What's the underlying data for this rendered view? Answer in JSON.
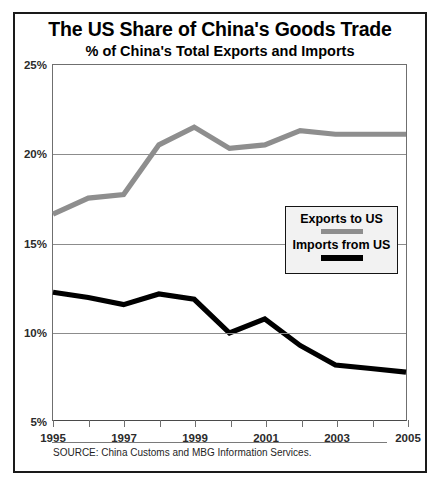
{
  "chart_data": {
    "type": "line",
    "title": "The US Share of China's Goods Trade",
    "subtitle": "% of China's Total Exports and Imports",
    "xlabel": "",
    "ylabel": "",
    "xlim": [
      1995,
      2005
    ],
    "ylim": [
      5,
      25
    ],
    "yticks": [
      25,
      20,
      15,
      10,
      5
    ],
    "ytick_labels": [
      "25%",
      "20%",
      "15%",
      "10%",
      "5%"
    ],
    "x": [
      1995,
      1996,
      1997,
      1998,
      1999,
      2000,
      2001,
      2002,
      2003,
      2004,
      2005
    ],
    "xticks": [
      1995,
      1996,
      1997,
      1998,
      1999,
      2000,
      2001,
      2002,
      2003,
      2004,
      2005
    ],
    "xtick_labels": [
      "1995",
      "",
      "1997",
      "",
      "1999",
      "",
      "2001",
      "",
      "2003",
      "",
      "2005"
    ],
    "grid": true,
    "grid_axis": "y",
    "legend_position": "center-right",
    "series": [
      {
        "name": "Exports to US",
        "color": "#8e8e8e",
        "values": [
          16.6,
          17.5,
          17.7,
          20.5,
          21.5,
          20.3,
          20.5,
          21.3,
          21.1,
          21.1,
          21.1
        ]
      },
      {
        "name": "Imports from US",
        "color": "#000000",
        "values": [
          12.2,
          11.9,
          11.5,
          12.1,
          11.8,
          9.9,
          10.7,
          9.2,
          8.1,
          7.9,
          7.7
        ]
      }
    ],
    "source": "SOURCE: China Customs and MBG Information Services."
  },
  "legend": {
    "entries": [
      {
        "label": "Exports to US"
      },
      {
        "label": "Imports from US"
      }
    ]
  }
}
